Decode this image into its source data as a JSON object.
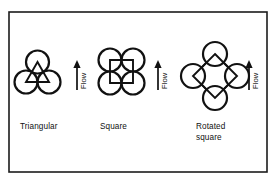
{
  "figure": {
    "name": "tube-layout-patterns",
    "width": 276,
    "height": 185,
    "background_color": "#ffffff",
    "border_color": "#1c1c1c",
    "line_color": "#111111"
  },
  "patterns": [
    {
      "id": "triangular",
      "label": "Triangular",
      "label_lines": [
        "Triangular"
      ],
      "geometry": "three tubes, centers form an inverted equilateral triangle",
      "tube_count": 3,
      "tube_radius": 11.5,
      "centers": [
        {
          "cx": 37.5,
          "cy": 62.0
        },
        {
          "cx": 26.0,
          "cy": 82.0
        },
        {
          "cx": 49.0,
          "cy": 82.0
        }
      ],
      "pitch_path": "M 37.5 62 L 26 82 L 49 82 Z",
      "label_x": 20.0,
      "label_y": 129.0
    },
    {
      "id": "square",
      "label": "Square",
      "label_lines": [
        "Square"
      ],
      "geometry": "four tubes, centers form an upright square",
      "tube_count": 4,
      "tube_radius": 11.5,
      "centers": [
        {
          "cx": 110.0,
          "cy": 60.0
        },
        {
          "cx": 133.0,
          "cy": 60.0
        },
        {
          "cx": 110.0,
          "cy": 83.0
        },
        {
          "cx": 133.0,
          "cy": 83.0
        }
      ],
      "pitch_path": "M 110 60 L 133 60 L 133 83 L 110 83 Z",
      "label_x": 100.0,
      "label_y": 129.0
    },
    {
      "id": "rotated-square",
      "label": "Rotated square",
      "label_lines": [
        "Rotated",
        "square"
      ],
      "geometry": "four tubes, centers form a square rotated 45 degrees",
      "tube_count": 4,
      "tube_radius": 12.0,
      "centers": [
        {
          "cx": 215.0,
          "cy": 54.0
        },
        {
          "cx": 193.0,
          "cy": 76.0
        },
        {
          "cx": 237.0,
          "cy": 76.0
        },
        {
          "cx": 215.0,
          "cy": 98.0
        }
      ],
      "pitch_path": "M 215 54 L 237 76 L 215 98 L 193 76 Z",
      "label_x": 196.0,
      "label_y": 129.0,
      "label_line_height": 10.5
    }
  ],
  "flow_markers": [
    {
      "id": "flow-1",
      "label": "Flow",
      "direction": "up",
      "arrow_x": 77.0,
      "arrow_top_y": 61.0,
      "arrow_bottom_y": 90.0,
      "label_x": 86.0,
      "label_y": 89.0
    },
    {
      "id": "flow-2",
      "label": "Flow",
      "direction": "up",
      "arrow_x": 158.0,
      "arrow_top_y": 61.0,
      "arrow_bottom_y": 90.0,
      "label_x": 167.0,
      "label_y": 89.0
    },
    {
      "id": "flow-3",
      "label": "Flow",
      "direction": "up",
      "arrow_x": 249.0,
      "arrow_top_y": 61.0,
      "arrow_bottom_y": 90.0,
      "label_x": 258.0,
      "label_y": 89.0
    }
  ],
  "frame": {
    "x": 9.0,
    "y": 12.0,
    "width": 258.0,
    "height": 160.0
  }
}
